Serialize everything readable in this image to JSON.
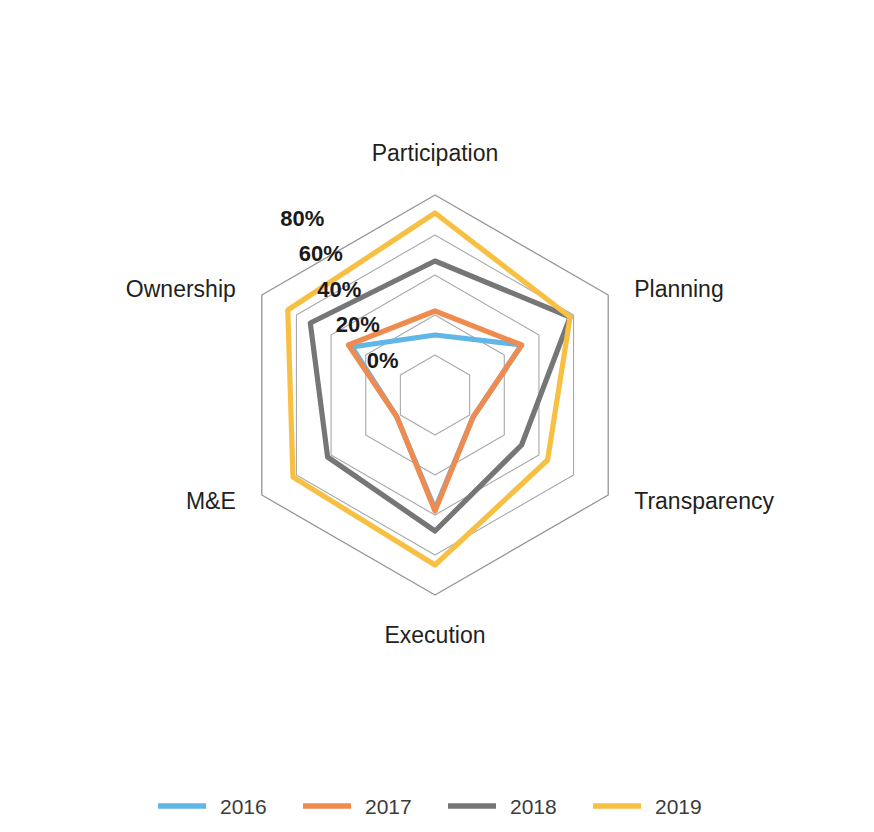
{
  "chart_data": {
    "type": "radar",
    "title": "",
    "subtitle": "",
    "xlabel": "",
    "ylabel": "",
    "categories": [
      "Participation",
      "Planning",
      "Transparency",
      "Execution",
      "M&E",
      "Ownership"
    ],
    "tick_labels": [
      "0%",
      "20%",
      "40%",
      "60%",
      "80%"
    ],
    "tick_values": [
      0,
      20,
      40,
      60,
      80
    ],
    "rlim": [
      0,
      80
    ],
    "grid": true,
    "legend_position": "bottom",
    "value_suffix": "%",
    "series": [
      {
        "name": "2016",
        "color": "#61b6e8",
        "values": [
          10,
          30,
          2,
          37,
          2,
          28
        ]
      },
      {
        "name": "2017",
        "color": "#f08b4f",
        "values": [
          22,
          30,
          2,
          38,
          2,
          30
        ]
      },
      {
        "name": "2018",
        "color": "#767676",
        "values": [
          47,
          58,
          30,
          48,
          42,
          52
        ]
      },
      {
        "name": "2019",
        "color": "#f8c043",
        "values": [
          71,
          58,
          45,
          65,
          62,
          65
        ]
      }
    ]
  },
  "legend": {
    "items": [
      {
        "label": "2016",
        "color": "#61b6e8"
      },
      {
        "label": "2017",
        "color": "#f08b4f"
      },
      {
        "label": "2018",
        "color": "#767676"
      },
      {
        "label": "2019",
        "color": "#f8c043"
      }
    ]
  },
  "axes": {
    "labels": [
      "Participation",
      "Planning",
      "Transparency",
      "Execution",
      "M&E",
      "Ownership"
    ]
  },
  "ticks": {
    "labels": [
      "0%",
      "20%",
      "40%",
      "60%",
      "80%"
    ]
  },
  "colors": {
    "grid": "#a7a9ac",
    "outer_grid": "#939598",
    "text": "#231f20",
    "background": "#ffffff"
  }
}
